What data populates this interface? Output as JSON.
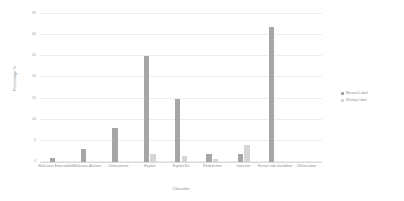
{
  "chart_data": {
    "type": "bar",
    "title": "",
    "xlabel": "Classifier",
    "ylabel": "Percentage %",
    "ylim": [
      0,
      35
    ],
    "yticks": [
      0,
      5,
      10,
      15,
      20,
      25,
      30,
      35
    ],
    "grid": true,
    "legend_position": "right",
    "categories": [
      "Malicious Executable",
      "Malicious Archive",
      "Defacement",
      "Exploit",
      "Exploit Kit",
      "Redirection",
      "Injection",
      "Server side backdoor",
      "Obfuscation"
    ],
    "series": [
      {
        "name": "Missed Label",
        "color": "#a6a6a6",
        "values": [
          1,
          3,
          8,
          25,
          15,
          2,
          2,
          32,
          0
        ]
      },
      {
        "name": "Wrong Label",
        "color": "#d5d5d5",
        "values": [
          0,
          0,
          0,
          2,
          1.5,
          0.8,
          4,
          0,
          0
        ]
      }
    ]
  },
  "legend": {
    "entries": [
      {
        "label": "Missed Label",
        "color": "#a6a6a6"
      },
      {
        "label": "Wrong Label",
        "color": "#d5d5d5"
      }
    ]
  }
}
